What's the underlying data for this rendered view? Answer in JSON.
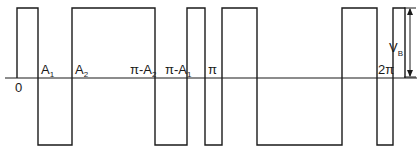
{
  "diagram": {
    "type": "bipolar-square-waveform",
    "amplitude_label": "V",
    "amplitude_subscript": "B",
    "x_labels": [
      {
        "id": "zero",
        "text": "0"
      },
      {
        "id": "a1",
        "text": "A",
        "sub": "1"
      },
      {
        "id": "a2",
        "text": "A",
        "sub": "2"
      },
      {
        "id": "pi-minus-a2",
        "text": "π-A",
        "sub": "2"
      },
      {
        "id": "pi-minus-a1",
        "text": "π-A",
        "sub": "1"
      },
      {
        "id": "pi",
        "text": "π"
      },
      {
        "id": "two-pi",
        "text": "2π"
      }
    ],
    "colors": {
      "stroke": "#1a1a1a",
      "background": "#ffffff"
    }
  }
}
